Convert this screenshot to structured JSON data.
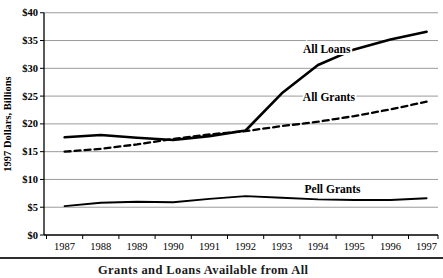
{
  "chart_data": {
    "type": "line",
    "title": "",
    "xlabel": "",
    "ylabel": "1997 Dollars, Billions",
    "ylim": [
      0,
      40
    ],
    "y_tick_step": 5,
    "grid": "horizontal",
    "legend": "inline-labels",
    "x_tick_labels": [
      "1987",
      "1988",
      "1989",
      "1990",
      "1991",
      "1992",
      "1993",
      "1994",
      "1995",
      "1996",
      "1997"
    ],
    "y_tick_labels": [
      "$0",
      "$5",
      "$10",
      "$15",
      "$20",
      "$25",
      "$30",
      "$35",
      "$40"
    ],
    "series": [
      {
        "name": "All Loans",
        "style": "solid-thick",
        "values": [
          17.6,
          18.0,
          17.5,
          17.1,
          17.8,
          18.8,
          25.5,
          30.6,
          33.4,
          35.2,
          36.6
        ]
      },
      {
        "name": "All Grants",
        "style": "dashed",
        "values": [
          15.0,
          15.5,
          16.3,
          17.3,
          18.1,
          18.7,
          19.6,
          20.4,
          21.4,
          22.6,
          24.0
        ]
      },
      {
        "name": "Pell Grants",
        "style": "solid",
        "values": [
          5.2,
          5.8,
          6.0,
          5.9,
          6.5,
          7.0,
          6.7,
          6.4,
          6.3,
          6.3,
          6.6
        ]
      }
    ],
    "annotations": [
      {
        "text": "All Loans",
        "x": 7.24,
        "y": 32.7
      },
      {
        "text": "All Grants",
        "x": 7.3,
        "y": 24.1
      },
      {
        "text": "Pell Grants",
        "x": 7.4,
        "y": 7.55
      }
    ],
    "colors": {
      "line": "#000000",
      "gridline": "#8f8f8f",
      "rule": "#2e2e2e"
    }
  },
  "caption": {
    "partial_text": "Grants and Loans Available from All"
  }
}
